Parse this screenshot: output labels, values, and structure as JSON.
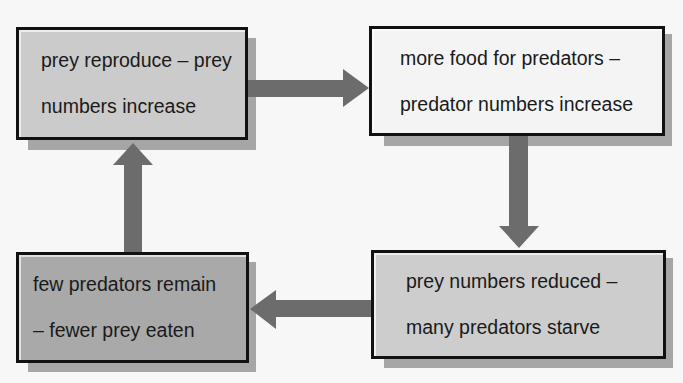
{
  "diagram": {
    "type": "cycle",
    "colors": {
      "background": "#f7f7f7",
      "box_light": "#f4f4f4",
      "box_medium": "#c8c8c8",
      "box_medium2": "#cdcdcd",
      "box_dark": "#a9a9a9",
      "border": "#111111",
      "shadow": "#a6a6a6",
      "arrow": "#6c6c6c"
    },
    "nodes": [
      {
        "id": "prey-reproduce",
        "line1": "prey reproduce – prey",
        "line2": "numbers increase",
        "position": "top-left"
      },
      {
        "id": "more-food",
        "line1": "more food for predators –",
        "line2": "predator numbers increase",
        "position": "top-right"
      },
      {
        "id": "prey-reduced",
        "line1": "prey numbers reduced –",
        "line2": "many predators starve",
        "position": "bottom-right"
      },
      {
        "id": "few-predators",
        "line1": "few predators remain",
        "line2": "– fewer prey eaten",
        "position": "bottom-left"
      }
    ],
    "edges": [
      {
        "from": "prey-reproduce",
        "to": "more-food",
        "direction": "right"
      },
      {
        "from": "more-food",
        "to": "prey-reduced",
        "direction": "down"
      },
      {
        "from": "prey-reduced",
        "to": "few-predators",
        "direction": "left"
      },
      {
        "from": "few-predators",
        "to": "prey-reproduce",
        "direction": "up"
      }
    ]
  }
}
